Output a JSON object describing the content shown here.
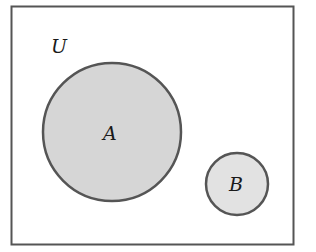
{
  "diagram": {
    "type": "venn",
    "universe": {
      "label": "U",
      "stroke": "#555555",
      "fill": "#ffffff"
    },
    "sets": [
      {
        "label": "A",
        "fill": "#d6d6d6",
        "stroke": "#555555"
      },
      {
        "label": "B",
        "fill": "#e2e2e2",
        "stroke": "#555555"
      }
    ],
    "relationship": "disjoint"
  }
}
